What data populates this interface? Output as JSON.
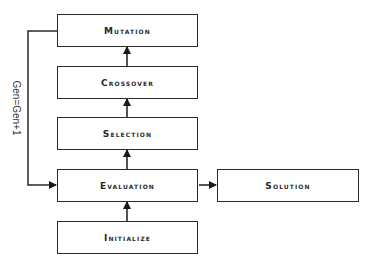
{
  "diagram": {
    "type": "flowchart",
    "colors": {
      "stroke": "#2a2a2a",
      "background": "#ffffff",
      "text": "#2a2a2a"
    },
    "nodes": {
      "mutation": {
        "label": "Mutation"
      },
      "crossover": {
        "label": "Crossover"
      },
      "selection": {
        "label": "Selection"
      },
      "evaluation": {
        "label": "Evaluation"
      },
      "initialize": {
        "label": "Initialize"
      },
      "solution": {
        "label": "Solution"
      }
    },
    "edges": [
      {
        "from": "initialize",
        "to": "evaluation"
      },
      {
        "from": "evaluation",
        "to": "selection"
      },
      {
        "from": "selection",
        "to": "crossover"
      },
      {
        "from": "crossover",
        "to": "mutation"
      },
      {
        "from": "mutation",
        "to": "evaluation",
        "label": "Gen=Gen+1"
      },
      {
        "from": "evaluation",
        "to": "solution"
      }
    ],
    "loop_label": "Gen=Gen+1"
  }
}
